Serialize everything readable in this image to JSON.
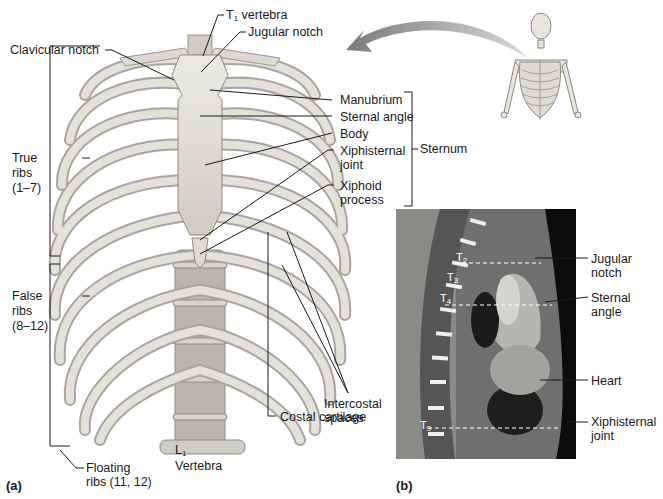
{
  "figure": {
    "panel_a": {
      "label": "(a)",
      "labels": {
        "t1_vertebra": "T",
        "t1_sub": "1",
        "t1_rest": " vertebra",
        "jugular_notch": "Jugular notch",
        "clavicular_notch": "Clavicular notch",
        "manubrium": "Manubrium",
        "sternal_angle": "Sternal angle",
        "body": "Body",
        "xiphisternal_joint_1": "Xiphisternal",
        "xiphisternal_joint_2": "joint",
        "xiphoid_process_1": "Xiphoid",
        "xiphoid_process_2": "process",
        "sternum": "Sternum",
        "true_ribs_1": "True",
        "true_ribs_2": "ribs",
        "true_ribs_3": "(1–7)",
        "false_ribs_1": "False",
        "false_ribs_2": "ribs",
        "false_ribs_3": "(8–12)",
        "floating_ribs_1": "Floating",
        "floating_ribs_2": "ribs (11, 12)",
        "l1_vertebra_a": "L",
        "l1_sub": "1",
        "l1_vertebra_b": "Vertebra",
        "intercostal_1": "Intercostal",
        "intercostal_2": "spaces",
        "costal_cartilage": "Costal cartilage"
      }
    },
    "panel_b": {
      "label": "(b)",
      "vertebra_markers": [
        {
          "text": "T",
          "sub": "2"
        },
        {
          "text": "T",
          "sub": "3"
        },
        {
          "text": "T",
          "sub": "4"
        },
        {
          "text": "T",
          "sub": "9"
        }
      ],
      "labels": {
        "jugular_notch_1": "Jugular",
        "jugular_notch_2": "notch",
        "sternal_angle_1": "Sternal",
        "sternal_angle_2": "angle",
        "heart": "Heart",
        "xiphisternal_1": "Xiphisternal",
        "xiphisternal_2": "joint"
      }
    }
  }
}
